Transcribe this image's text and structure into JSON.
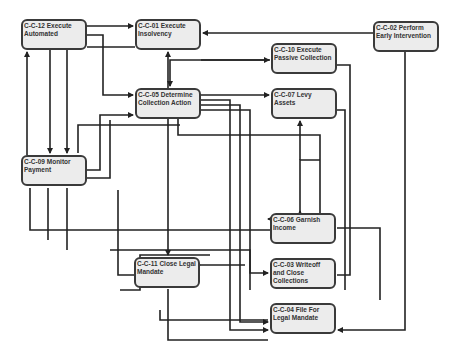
{
  "diagram": {
    "nodes": [
      {
        "id": "C-C-12",
        "label": "C-C-12 Execute Automated",
        "x": 21,
        "y": 19,
        "w": 66,
        "h": 31
      },
      {
        "id": "C-C-01",
        "label": "C-C-01 Execute Insolvency",
        "x": 135,
        "y": 19,
        "w": 66,
        "h": 31
      },
      {
        "id": "C-C-02",
        "label": "C-C-02 Perform Early Intervention",
        "x": 373,
        "y": 21,
        "w": 66,
        "h": 31
      },
      {
        "id": "C-C-10",
        "label": "C-C-10 Execute Passive Collection",
        "x": 271,
        "y": 43,
        "w": 66,
        "h": 31
      },
      {
        "id": "C-C-05",
        "label": "C-C-05 Determine Collection Action",
        "x": 135,
        "y": 88,
        "w": 66,
        "h": 31
      },
      {
        "id": "C-C-07",
        "label": "C-C-07 Levy Assets",
        "x": 271,
        "y": 88,
        "w": 66,
        "h": 31
      },
      {
        "id": "C-C-09",
        "label": "C-C-09 Monitor Payment",
        "x": 21,
        "y": 155,
        "w": 66,
        "h": 31
      },
      {
        "id": "C-C-06",
        "label": "C-C-06 Garnish Income",
        "x": 270,
        "y": 213,
        "w": 66,
        "h": 31
      },
      {
        "id": "C-C-11",
        "label": "C-C-11 Close Legal Mandate",
        "x": 134,
        "y": 257,
        "w": 66,
        "h": 31
      },
      {
        "id": "C-C-03",
        "label": "C-C-03 Writeoff and Close Collections",
        "x": 270,
        "y": 258,
        "w": 66,
        "h": 31
      },
      {
        "id": "C-C-04",
        "label": "C-C-04 File For Legal Mandate",
        "x": 270,
        "y": 303,
        "w": 66,
        "h": 31
      }
    ],
    "colors": {
      "node_fill": "#ececec",
      "node_border": "#3a3a3a",
      "edge": "#222222",
      "text": "#333333"
    }
  }
}
